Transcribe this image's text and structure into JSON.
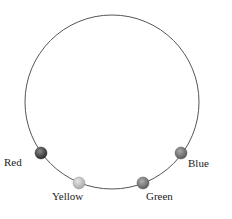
{
  "diagram": {
    "circle": {
      "cx": 112,
      "cy": 102,
      "r": 87,
      "stroke": "#555555"
    },
    "beads": [
      {
        "name": "Red",
        "label": "Red",
        "cx": 41,
        "cy": 153,
        "color": "#3a3a3a",
        "label_x": 4,
        "label_y": 166
      },
      {
        "name": "Yellow",
        "label": "Yellow",
        "cx": 79,
        "cy": 183,
        "color": "#bdbdbd",
        "label_x": 52,
        "label_y": 200
      },
      {
        "name": "Green",
        "label": "Green",
        "cx": 143,
        "cy": 183,
        "color": "#7a7a7a",
        "label_x": 146,
        "label_y": 200
      },
      {
        "name": "Blue",
        "label": "Blue",
        "cx": 181,
        "cy": 153,
        "color": "#777777",
        "label_x": 188,
        "label_y": 167
      }
    ]
  }
}
